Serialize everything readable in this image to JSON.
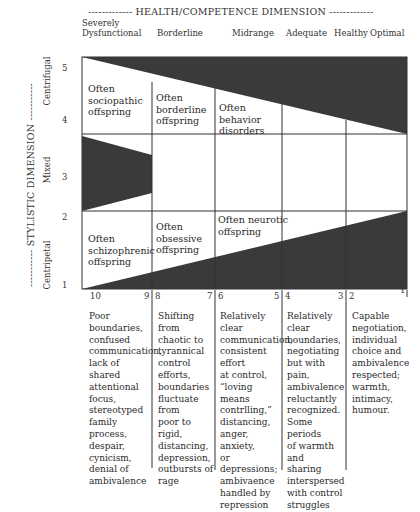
{
  "header": {
    "title": "-------------  HEALTH/COMPETENCE DIMENSION  -------------",
    "columns": [
      {
        "label": "Severely\nDysfunctional",
        "line1": "Severely",
        "line2": "Dysfunctional"
      },
      {
        "label": "Borderline"
      },
      {
        "label": "Midrange"
      },
      {
        "label": "Adequate"
      },
      {
        "label": "Healthy"
      },
      {
        "label": "Optimal"
      }
    ]
  },
  "side": {
    "title": "-----------  STYLISTIC DIMENSION  -----------",
    "rows": [
      {
        "label": "Centrifugal"
      },
      {
        "label": "Mixed"
      },
      {
        "label": "Centripetal"
      }
    ],
    "ticks": [
      "5",
      "4",
      "3",
      "2",
      "1"
    ]
  },
  "cells": {
    "sociopathic": [
      "Often",
      "sociopathic",
      "offspring"
    ],
    "borderline": [
      "Often",
      "borderline",
      "offspring"
    ],
    "behavior": [
      "Often",
      "behavior",
      "disorders"
    ],
    "schizophrenic": [
      "Often",
      "schizophrenic",
      "offspring"
    ],
    "obsessive": [
      "Often",
      "obsessive",
      "offspring"
    ],
    "neurotic": [
      "Often neurotic",
      "offspring"
    ]
  },
  "scale": [
    {
      "left": "10",
      "right": "9"
    },
    {
      "left": "8",
      "right": "7"
    },
    {
      "left": "6",
      "right": "5"
    },
    {
      "left": "4",
      "right": "3"
    },
    {
      "left": "2",
      "right": "1"
    }
  ],
  "descriptions": [
    [
      "Poor",
      "boundaries,",
      "confused",
      "communication,",
      "lack of shared",
      "attentional",
      "focus,",
      "stereotyped",
      "family process,",
      "despair,",
      "cynicism,",
      "denial of",
      "ambivalence"
    ],
    [
      "Shifting from",
      "chaotic to",
      "tyrannical",
      "control",
      "efforts,",
      "boundaries",
      "fluctuate from",
      "poor to rigid,",
      "distancing,",
      "depression,",
      "outbursts of",
      "rage"
    ],
    [
      "Relatively clear",
      "communication,",
      "consistent effort",
      "at control,",
      "“loving means",
      "contrlling,”",
      "distancing,",
      "anger, anxiety,",
      "or depressions;",
      "ambivaence",
      "handled by",
      "repression"
    ],
    [
      "Relatively",
      "clear",
      "boundaries,",
      "negotiating",
      "but with pain,",
      "ambivalence",
      "reluctantly",
      "recognized.",
      "Some periods",
      "of warmth and",
      "sharing",
      "interspersed",
      "with control",
      "struggles"
    ],
    [
      "Capable",
      "negotiation,",
      "individual",
      "choice and",
      "ambivalence",
      "respected;",
      "warmth,",
      "intimacy,",
      "humour."
    ]
  ],
  "colors": {
    "fill": "#3a3a3a",
    "line": "#333333",
    "text": "#2a2a2a"
  }
}
